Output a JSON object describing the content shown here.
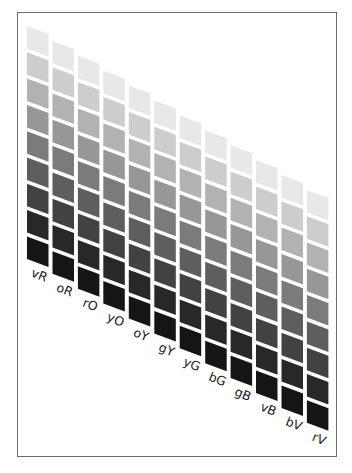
{
  "chart_data": {
    "type": "heatmap",
    "title": "",
    "columns": [
      "vR",
      "oR",
      "rO",
      "yO",
      "oY",
      "gY",
      "yG",
      "bG",
      "gB",
      "vB",
      "bV",
      "rV"
    ],
    "rows": 9,
    "row_colors": [
      "#e8e8e8",
      "#cdcdcd",
      "#b2b2b2",
      "#979797",
      "#7b7b7b",
      "#5e5e5e",
      "#424242",
      "#282828",
      "#151515"
    ],
    "grid": false,
    "legend": "none"
  },
  "frame": {
    "border_color": "#6e6e6e"
  }
}
